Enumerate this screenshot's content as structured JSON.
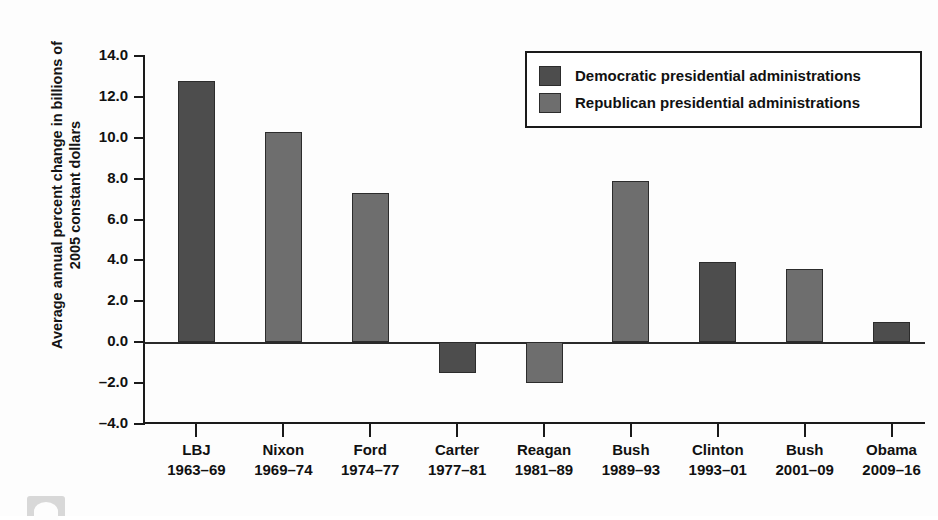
{
  "figure": {
    "clipped_header_text": "",
    "ylabel": "Average annual percent change in billions of 2005 constant dollars"
  },
  "legend": {
    "items": [
      {
        "key": "dem",
        "label": "Democratic presidential administrations",
        "color": "#4d4d4d"
      },
      {
        "key": "rep",
        "label": "Republican presidential administrations",
        "color": "#6e6e6e"
      }
    ]
  },
  "chart_data": {
    "type": "bar",
    "title": "",
    "xlabel": "",
    "ylabel": "Average annual percent change in billions of 2005 constant dollars",
    "ylim": [
      -4.0,
      14.0
    ],
    "ytick_labels": [
      "14.0",
      "12.0",
      "10.0",
      "8.0",
      "6.0",
      "4.0",
      "2.0",
      "0.0",
      "-2.0",
      "-4.0"
    ],
    "ytick_values": [
      14.0,
      12.0,
      10.0,
      8.0,
      6.0,
      4.0,
      2.0,
      0.0,
      -2.0,
      -4.0
    ],
    "grid": false,
    "legend_position": "top-right",
    "categories": [
      "LBJ",
      "Nixon",
      "Ford",
      "Carter",
      "Reagan",
      "Bush",
      "Clinton",
      "Bush",
      "Obama"
    ],
    "category_sublabels": [
      "1963–69",
      "1969–74",
      "1974–77",
      "1977–81",
      "1981–89",
      "1989–93",
      "1993–01",
      "2001–09",
      "2009–16"
    ],
    "party": [
      "dem",
      "rep",
      "rep",
      "dem",
      "rep",
      "rep",
      "dem",
      "rep",
      "dem"
    ],
    "values": [
      12.8,
      10.3,
      7.3,
      -1.5,
      -2.0,
      7.9,
      3.9,
      3.6,
      1.0
    ],
    "series": [
      {
        "name": "Average annual percent change in billions of 2005 constant dollars",
        "values": [
          12.8,
          10.3,
          7.3,
          -1.5,
          -2.0,
          7.9,
          3.9,
          3.6,
          1.0
        ]
      }
    ]
  }
}
